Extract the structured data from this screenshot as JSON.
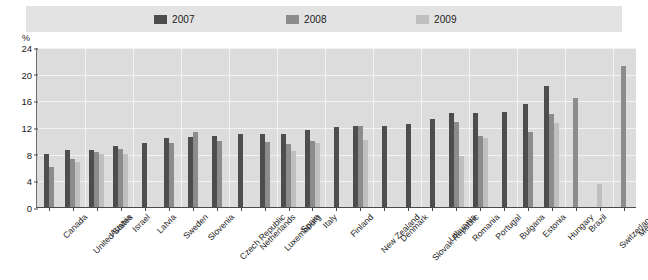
{
  "legend": {
    "position": "top",
    "items": [
      {
        "label": "2007",
        "color": "#4d4d4d",
        "icon": "legend-swatch-icon"
      },
      {
        "label": "2008",
        "color": "#8c8c8c",
        "icon": "legend-swatch-icon"
      },
      {
        "label": "2009",
        "color": "#bfbfbf",
        "icon": "legend-swatch-icon"
      }
    ]
  },
  "axis": {
    "unit": "%",
    "yticks": [
      "0",
      "4",
      "8",
      "12",
      "16",
      "20",
      "24"
    ]
  },
  "chart_data": {
    "type": "bar",
    "title": "",
    "subtitle": "",
    "xlabel": "",
    "ylabel": "%",
    "ylim": [
      0,
      24
    ],
    "ytick_step": 4,
    "grid": true,
    "legend_position": "top",
    "categories": [
      "Canada",
      "United States",
      "Austria",
      "Israel",
      "Latvia",
      "Sweden",
      "Slovenia",
      "Czech Republic",
      "Netherlands",
      "Luxembourg",
      "Spain",
      "Italy",
      "Finland",
      "New Zealand",
      "Denmark",
      "Slovak Republic",
      "Lithuania",
      "Romania",
      "Portugal",
      "Bulgaria",
      "Estonia",
      "Hungary",
      "Brazil",
      "Switzerland",
      "Mexico"
    ],
    "series": [
      {
        "name": "2007",
        "color": "#4d4d4d",
        "values": [
          8.0,
          8.6,
          8.6,
          9.1,
          9.6,
          10.3,
          10.5,
          10.6,
          11.0,
          11.0,
          11.0,
          11.6,
          12.0,
          12.1,
          12.2,
          12.5,
          13.2,
          14.1,
          14.1,
          14.2,
          15.5,
          18.1,
          null,
          null,
          null
        ]
      },
      {
        "name": "2008",
        "color": "#8c8c8c",
        "values": [
          6.0,
          7.2,
          8.2,
          8.7,
          null,
          9.6,
          11.2,
          9.9,
          null,
          9.7,
          9.4,
          9.9,
          null,
          12.2,
          null,
          null,
          null,
          12.7,
          10.6,
          null,
          11.2,
          14.0,
          16.3,
          null,
          21.2
        ]
      },
      {
        "name": "2009",
        "color": "#bfbfbf",
        "values": [
          null,
          6.8,
          8.0,
          8.0,
          null,
          null,
          null,
          null,
          null,
          null,
          8.4,
          9.6,
          null,
          10.0,
          null,
          null,
          null,
          7.6,
          10.3,
          null,
          null,
          12.6,
          null,
          3.5,
          null
        ]
      }
    ]
  }
}
